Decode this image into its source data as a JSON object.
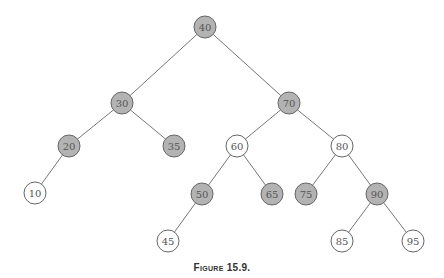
{
  "colors": {
    "black_node": "#b3b3b3",
    "red_node": "#ffffff",
    "stroke": "#666666",
    "edge": "#777777"
  },
  "nodes": [
    {
      "id": "40",
      "x": 205,
      "y": 27,
      "color": "gray"
    },
    {
      "id": "30",
      "x": 122,
      "y": 103,
      "color": "gray"
    },
    {
      "id": "70",
      "x": 289,
      "y": 103,
      "color": "gray"
    },
    {
      "id": "20",
      "x": 69,
      "y": 146,
      "color": "gray"
    },
    {
      "id": "35",
      "x": 174,
      "y": 146,
      "color": "gray"
    },
    {
      "id": "60",
      "x": 237,
      "y": 146,
      "color": "white"
    },
    {
      "id": "80",
      "x": 342,
      "y": 146,
      "color": "white"
    },
    {
      "id": "10",
      "x": 35,
      "y": 193,
      "color": "white"
    },
    {
      "id": "50",
      "x": 202,
      "y": 194,
      "color": "gray"
    },
    {
      "id": "65",
      "x": 272,
      "y": 194,
      "color": "gray"
    },
    {
      "id": "75",
      "x": 306,
      "y": 194,
      "color": "gray"
    },
    {
      "id": "90",
      "x": 377,
      "y": 194,
      "color": "gray"
    },
    {
      "id": "45",
      "x": 168,
      "y": 241,
      "color": "white"
    },
    {
      "id": "85",
      "x": 342,
      "y": 241,
      "color": "white"
    },
    {
      "id": "95",
      "x": 413,
      "y": 241,
      "color": "white"
    }
  ],
  "edges": [
    [
      "40",
      "30"
    ],
    [
      "40",
      "70"
    ],
    [
      "30",
      "20"
    ],
    [
      "30",
      "35"
    ],
    [
      "70",
      "60"
    ],
    [
      "70",
      "80"
    ],
    [
      "20",
      "10"
    ],
    [
      "60",
      "50"
    ],
    [
      "60",
      "65"
    ],
    [
      "80",
      "75"
    ],
    [
      "80",
      "90"
    ],
    [
      "50",
      "45"
    ],
    [
      "90",
      "85"
    ],
    [
      "90",
      "95"
    ]
  ],
  "caption": "Figure 15.9."
}
